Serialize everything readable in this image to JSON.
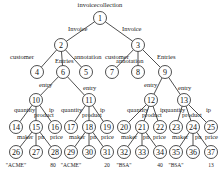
{
  "diagram": {
    "root_label": "invoicecollection",
    "nodes": [
      {
        "id": "1",
        "x": 100,
        "y": 18
      },
      {
        "id": "2",
        "x": 61,
        "y": 45
      },
      {
        "id": "3",
        "x": 138,
        "y": 45
      },
      {
        "id": "4",
        "x": 37,
        "y": 72
      },
      {
        "id": "6",
        "x": 63,
        "y": 72
      },
      {
        "id": "5",
        "x": 86,
        "y": 72
      },
      {
        "id": "7",
        "x": 112,
        "y": 72
      },
      {
        "id": "8",
        "x": 138,
        "y": 72
      },
      {
        "id": "9",
        "x": 165,
        "y": 72
      },
      {
        "id": "10",
        "x": 36,
        "y": 100
      },
      {
        "id": "11",
        "x": 89,
        "y": 100
      },
      {
        "id": "12",
        "x": 151,
        "y": 100
      },
      {
        "id": "13",
        "x": 184,
        "y": 100
      },
      {
        "id": "14",
        "x": 16,
        "y": 127
      },
      {
        "id": "15",
        "x": 36,
        "y": 127
      },
      {
        "id": "16",
        "x": 55,
        "y": 127
      },
      {
        "id": "17",
        "x": 71,
        "y": 127
      },
      {
        "id": "18",
        "x": 89,
        "y": 127
      },
      {
        "id": "19",
        "x": 107,
        "y": 127
      },
      {
        "id": "20",
        "x": 124,
        "y": 127
      },
      {
        "id": "21",
        "x": 142,
        "y": 127
      },
      {
        "id": "22",
        "x": 160,
        "y": 127
      },
      {
        "id": "23",
        "x": 176,
        "y": 127
      },
      {
        "id": "24",
        "x": 193,
        "y": 127
      },
      {
        "id": "25",
        "x": 211,
        "y": 127
      },
      {
        "id": "26",
        "x": 16,
        "y": 152
      },
      {
        "id": "27",
        "x": 36,
        "y": 152
      },
      {
        "id": "28",
        "x": 55,
        "y": 152
      },
      {
        "id": "29",
        "x": 71,
        "y": 152
      },
      {
        "id": "30",
        "x": 89,
        "y": 152
      },
      {
        "id": "31",
        "x": 107,
        "y": 152
      },
      {
        "id": "32",
        "x": 124,
        "y": 152
      },
      {
        "id": "33",
        "x": 142,
        "y": 152
      },
      {
        "id": "34",
        "x": 160,
        "y": 152
      },
      {
        "id": "35",
        "x": 176,
        "y": 152
      },
      {
        "id": "36",
        "x": 193,
        "y": 152
      },
      {
        "id": "37",
        "x": 211,
        "y": 152
      }
    ],
    "edges": [
      {
        "from": "1",
        "to": "2",
        "label": "Invoice",
        "lx": 68,
        "ly": 31
      },
      {
        "from": "1",
        "to": "3",
        "label": "Invoice",
        "lx": 122,
        "ly": 31
      },
      {
        "from": "2",
        "to": "4",
        "label": "customer",
        "lx": 10,
        "ly": 59
      },
      {
        "from": "2",
        "to": "6",
        "label": "Entries",
        "lx": 55,
        "ly": 63
      },
      {
        "from": "2",
        "to": "5",
        "label": "annotation",
        "lx": 74,
        "ly": 59
      },
      {
        "from": "3",
        "to": "7",
        "label": "customer",
        "lx": 105,
        "ly": 59
      },
      {
        "from": "3",
        "to": "8",
        "label": "annotation",
        "lx": 116,
        "ly": 63
      },
      {
        "from": "3",
        "to": "9",
        "label": "Entries",
        "lx": 157,
        "ly": 59
      },
      {
        "from": "6",
        "to": "10",
        "label": "entry",
        "lx": 39,
        "ly": 87
      },
      {
        "from": "6",
        "to": "11",
        "label": "entry",
        "lx": 83,
        "ly": 90
      },
      {
        "from": "9",
        "to": "12",
        "label": "entry",
        "lx": 144,
        "ly": 87
      },
      {
        "from": "9",
        "to": "13",
        "label": "entry",
        "lx": 178,
        "ly": 90
      },
      {
        "from": "10",
        "to": "14",
        "label": "quantity",
        "lx": 14,
        "ly": 112
      },
      {
        "from": "10",
        "to": "15",
        "label": "product",
        "lx": 34,
        "ly": 117
      },
      {
        "from": "10",
        "to": "16",
        "label": "ip",
        "lx": 49,
        "ly": 112
      },
      {
        "from": "11",
        "to": "17",
        "label": "quantity",
        "lx": 61,
        "ly": 112
      },
      {
        "from": "11",
        "to": "18",
        "label": "product",
        "lx": 82,
        "ly": 117
      },
      {
        "from": "11",
        "to": "19",
        "label": "ip",
        "lx": 100,
        "ly": 112
      },
      {
        "from": "12",
        "to": "20",
        "label": "quantity",
        "lx": 127,
        "ly": 112
      },
      {
        "from": "12",
        "to": "21",
        "label": "product",
        "lx": 142,
        "ly": 117
      },
      {
        "from": "12",
        "to": "22",
        "label": "ip",
        "lx": 160,
        "ly": 112
      },
      {
        "from": "13",
        "to": "23",
        "label": "quantity",
        "lx": 164,
        "ly": 112
      },
      {
        "from": "13",
        "to": "24",
        "label": "product",
        "lx": 182,
        "ly": 117
      },
      {
        "from": "13",
        "to": "25",
        "label": "ip",
        "lx": 206,
        "ly": 112
      },
      {
        "from": "15",
        "to": "26",
        "label": "maker",
        "lx": 17,
        "ly": 139
      },
      {
        "from": "15",
        "to": "27",
        "label": "pn",
        "lx": 38,
        "ly": 139
      },
      {
        "from": "15",
        "to": "28",
        "label": "price",
        "lx": 50,
        "ly": 139
      },
      {
        "from": "18",
        "to": "29",
        "label": "maker",
        "lx": 69,
        "ly": 139
      },
      {
        "from": "18",
        "to": "30",
        "label": "pn",
        "lx": 90,
        "ly": 139
      },
      {
        "from": "18",
        "to": "31",
        "label": "price",
        "lx": 101,
        "ly": 139
      },
      {
        "from": "21",
        "to": "32",
        "label": "maker",
        "lx": 121,
        "ly": 139
      },
      {
        "from": "21",
        "to": "33",
        "label": "pn",
        "lx": 143,
        "ly": 139
      },
      {
        "from": "21",
        "to": "34",
        "label": "price",
        "lx": 153,
        "ly": 139
      },
      {
        "from": "24",
        "to": "35",
        "label": "maker",
        "lx": 172,
        "ly": 139
      },
      {
        "from": "24",
        "to": "36",
        "label": "pn",
        "lx": 195,
        "ly": 139
      },
      {
        "from": "24",
        "to": "37",
        "label": "price",
        "lx": 205,
        "ly": 139
      }
    ],
    "leaf_values": [
      {
        "node": "26",
        "value": "\"ACME\"",
        "x": 16,
        "y": 167
      },
      {
        "node": "28",
        "value": "80",
        "x": 53,
        "y": 167
      },
      {
        "node": "29",
        "value": "\"ACME\"",
        "x": 71,
        "y": 167
      },
      {
        "node": "31",
        "value": "20",
        "x": 107,
        "y": 167
      },
      {
        "node": "32",
        "value": "\"BSA\"",
        "x": 124,
        "y": 167
      },
      {
        "node": "34",
        "value": "40",
        "x": 160,
        "y": 167
      },
      {
        "node": "35",
        "value": "\"BSA\"",
        "x": 176,
        "y": 167
      },
      {
        "node": "37",
        "value": "13",
        "x": 211,
        "y": 167
      }
    ]
  }
}
